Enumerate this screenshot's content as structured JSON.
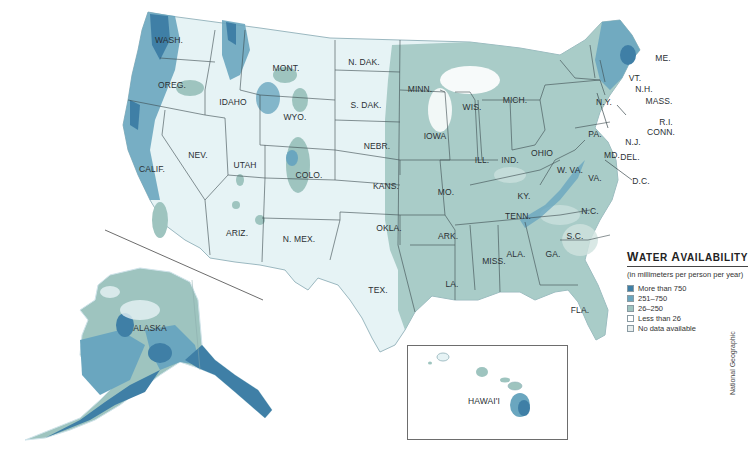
{
  "map": {
    "title": "Water Availability",
    "colors": {
      "ocean": "#ffffff",
      "more_than_750": "#3f7fa6",
      "r251_750": "#6aa6bf",
      "r26_250": "#9ec4bf",
      "less_than_26": "#e6f3f5",
      "no_data": "#e8eeee",
      "border": "#3c4a4f"
    }
  },
  "labels": {
    "wash": "WASH.",
    "oreg": "OREG.",
    "calif": "CALIF.",
    "nev": "NEV.",
    "idaho": "IDAHO",
    "mont": "MONT.",
    "wyo": "WYO.",
    "utah": "UTAH",
    "colo": "COLO.",
    "ariz": "ARIZ.",
    "nmex": "N. MEX.",
    "ndak": "N. DAK.",
    "sdak": "S. DAK.",
    "nebr": "NEBR.",
    "kans": "KANS.",
    "okla": "OKLA.",
    "tex": "TEX.",
    "minn": "MINN.",
    "iowa": "IOWA",
    "mo": "MO.",
    "ark": "ARK.",
    "la": "LA.",
    "wis": "WIS.",
    "ill": "ILL.",
    "mich": "MICH.",
    "ind": "IND.",
    "ohio": "OHIO",
    "ky": "KY.",
    "tenn": "TENN.",
    "miss": "MISS.",
    "ala": "ALA.",
    "ga": "GA.",
    "fla": "FLA.",
    "sc": "S.C.",
    "nc": "N.C.",
    "va": "VA.",
    "wva": "W. VA.",
    "md": "MD.",
    "del": "DEL.",
    "dc": "D.C.",
    "pa": "PA.",
    "nj": "N.J.",
    "ny": "N.Y.",
    "conn": "CONN.",
    "ri": "R.I.",
    "mass": "MASS.",
    "nh": "N.H.",
    "vt": "VT.",
    "me": "ME.",
    "alaska": "ALASKA",
    "hawaii": "HAWAI'I"
  },
  "legend": {
    "title_first": "W",
    "title_rest1": "ATER ",
    "title_second": "A",
    "title_rest2": "VAILABILITY",
    "subtitle": "(in millimeters per person per year)",
    "items": [
      {
        "label": "More than 750",
        "color": "#3f7fa6"
      },
      {
        "label": "251–750",
        "color": "#6aa6bf"
      },
      {
        "label": "26–250",
        "color": "#9ec4bf"
      },
      {
        "label": "Less than 26",
        "color": "#ffffff"
      },
      {
        "label": "No data available",
        "color": "#e8eeee"
      }
    ]
  },
  "credit": "National Geographic"
}
